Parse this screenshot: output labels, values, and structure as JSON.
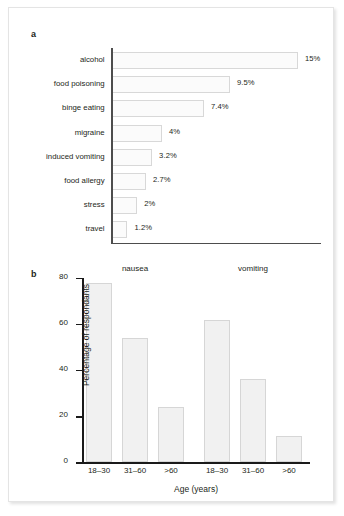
{
  "figure": {
    "panel_a_letter": "a",
    "panel_b_letter": "b"
  },
  "chart_data": [
    {
      "type": "bar",
      "orientation": "horizontal",
      "panel": "a",
      "title": "",
      "xlabel": "",
      "ylabel": "",
      "xlim": [
        0,
        17
      ],
      "grid": false,
      "legend": false,
      "categories": [
        "alcohol",
        "food poisoning",
        "binge eating",
        "migraine",
        "induced vomiting",
        "food allergy",
        "stress",
        "travel"
      ],
      "values": [
        15,
        9.5,
        7.4,
        4,
        3.2,
        2.7,
        2,
        1.2
      ],
      "value_labels": [
        "15%",
        "9.5%",
        "7.4%",
        "4%",
        "3.2%",
        "2.7%",
        "2%",
        "1.2%"
      ]
    },
    {
      "type": "bar",
      "orientation": "vertical",
      "panel": "b",
      "title": "",
      "xlabel": "Age (years)",
      "ylabel": "Percentage of respondants",
      "ylim": [
        0,
        80
      ],
      "yticks": [
        0,
        20,
        40,
        60,
        80
      ],
      "ytick_labels": [
        "0",
        "20",
        "40",
        "60",
        "80"
      ],
      "grid": false,
      "legend": false,
      "group_titles": [
        "nausea",
        "vomiting"
      ],
      "categories": [
        "18–30",
        "31–60",
        ">60"
      ],
      "series": [
        {
          "name": "nausea",
          "values": [
            78,
            54,
            24
          ]
        },
        {
          "name": "vomiting",
          "values": [
            62,
            36,
            11.5
          ]
        }
      ]
    }
  ],
  "colors": {
    "bar_fill_a": "#fbfbfb",
    "bar_stroke_a": "#d8d8d8",
    "bar_fill_b": "#f1f1f1",
    "bar_stroke_b": "#d6d6d6",
    "axis_a": "#4d4d4d",
    "axis_b": "#1a1a1a",
    "text": "#231f20",
    "page_background": "#ffffff",
    "frame_border": "#e4e4e4"
  }
}
